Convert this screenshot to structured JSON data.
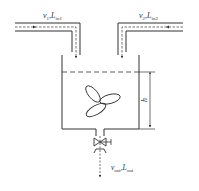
{
  "diagram": {
    "inlet1": {
      "v": "v",
      "v_sub": "1",
      "L": "L",
      "L_sub": "in1"
    },
    "inlet2": {
      "v": "v",
      "v_sub": "2",
      "L": "L",
      "L_sub": "in2"
    },
    "outlet": {
      "v": "v",
      "v_sub": "out",
      "L": "L",
      "L_sub": "out"
    },
    "level_label": "h",
    "separator": ",",
    "colors": {
      "stroke": "#333333",
      "background": "#ffffff"
    }
  }
}
